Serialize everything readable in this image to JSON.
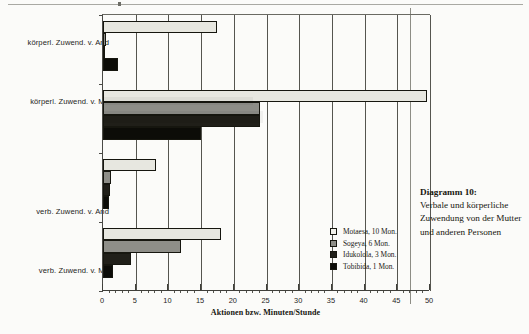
{
  "caption": {
    "title": "Diagramm 10:",
    "body": "Verbale und körperliche Zuwendung von der Mutter und anderen Personen"
  },
  "chart_data": {
    "type": "bar",
    "orientation": "horizontal",
    "title": "",
    "xlabel": "Aktionen bzw. Minuten/Stunde",
    "ylabel": "",
    "xlim": [
      0,
      50
    ],
    "xticks": [
      0,
      5,
      10,
      15,
      20,
      25,
      30,
      35,
      40,
      45,
      50
    ],
    "xtick_labels": [
      "0",
      "5",
      "10",
      "15",
      "20",
      "25",
      "30",
      "35",
      "40",
      "45",
      "50"
    ],
    "minor_tick_step": 1,
    "grid": true,
    "grid_axis": "x",
    "legend_position": "inside-right",
    "categories": [
      "körperl. Zuwend. v. And",
      "körperl. Zuwend. v. Mu",
      "verb. Zuwend. v. And",
      "verb. Zuwend. v. Mu"
    ],
    "series": [
      {
        "name": "Motaesa, 10 Mon.",
        "color": "#e7e7e0",
        "values": [
          17.4,
          49.5,
          8.1,
          18.0
        ]
      },
      {
        "name": "Sogeya, 6 Mon.",
        "color": "#8e8e88",
        "values": [
          0.5,
          24.0,
          1.2,
          12.0
        ]
      },
      {
        "name": "Idukolola, 3 Mon.",
        "color": "#201f19",
        "values": [
          0.3,
          24.0,
          1.1,
          4.3
        ]
      },
      {
        "name": "Tobibida, 1 Mon.",
        "color": "#0c0c08",
        "values": [
          2.3,
          15.0,
          0.9,
          1.5
        ]
      }
    ]
  }
}
